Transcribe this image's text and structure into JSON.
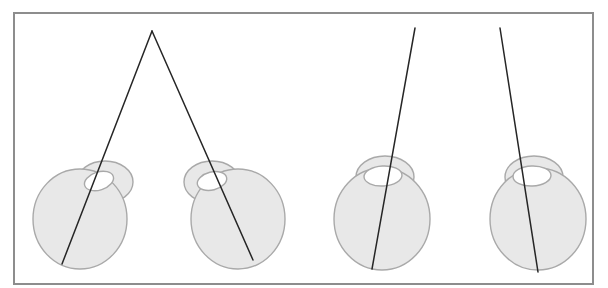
{
  "figure": {
    "title": "",
    "background_color": "#ffffff",
    "frame": {
      "x": 14,
      "y": 13,
      "width": 579,
      "height": 271,
      "stroke_color": "#8d8d8d",
      "stroke_width": 2
    },
    "colors": {
      "balloon_fill": "#e8e8e8",
      "balloon_stroke": "#a9a9a9",
      "hole_fill": "#ffffff",
      "line_stroke": "#262626"
    },
    "balloons": [
      {
        "id": "balloon-1",
        "label": "Balloon 1",
        "body_cx": 80,
        "body_cy": 219,
        "body_rx": 47,
        "body_ry": 50,
        "neck_cx": 105,
        "neck_cy": 182,
        "neck_rx": 28,
        "neck_ry": 21,
        "hole_cx": 99,
        "hole_cy": 181,
        "hole_rx": 15,
        "hole_ry": 9,
        "hole_rotate": -18
      },
      {
        "id": "balloon-2",
        "label": "Balloon 2",
        "body_cx": 238,
        "body_cy": 219,
        "body_rx": 47,
        "body_ry": 50,
        "neck_cx": 212,
        "neck_cy": 182,
        "neck_rx": 28,
        "neck_ry": 21,
        "hole_cx": 212,
        "hole_cy": 181,
        "hole_rx": 15,
        "hole_ry": 9,
        "hole_rotate": -14
      },
      {
        "id": "balloon-3",
        "label": "Balloon 3",
        "body_cx": 382,
        "body_cy": 219,
        "body_rx": 48,
        "body_ry": 51,
        "neck_cx": 385,
        "neck_cy": 177,
        "neck_rx": 29,
        "neck_ry": 21,
        "hole_cx": 383,
        "hole_cy": 176,
        "hole_rx": 19,
        "hole_ry": 10,
        "hole_rotate": -3
      },
      {
        "id": "balloon-4",
        "label": "Balloon 4",
        "body_cx": 538,
        "body_cy": 219,
        "body_rx": 48,
        "body_ry": 51,
        "neck_cx": 534,
        "neck_cy": 177,
        "neck_rx": 29,
        "neck_ry": 21,
        "hole_cx": 532,
        "hole_cy": 176,
        "hole_rx": 19,
        "hole_ry": 10,
        "hole_rotate": -2
      }
    ],
    "lines": [
      {
        "id": "line-1",
        "label": "Line 1",
        "x1": 152,
        "y1": 31,
        "x2": 62,
        "y2": 264
      },
      {
        "id": "line-2",
        "label": "Line 2",
        "x1": 152,
        "y1": 31,
        "x2": 253,
        "y2": 260
      },
      {
        "id": "line-3",
        "label": "Line 3",
        "x1": 415,
        "y1": 28,
        "x2": 372,
        "y2": 269
      },
      {
        "id": "line-4",
        "label": "Line 4",
        "x1": 500,
        "y1": 28,
        "x2": 538,
        "y2": 272
      }
    ],
    "apex": {
      "x": 152,
      "y": 31,
      "label": "Convergence apex"
    }
  }
}
